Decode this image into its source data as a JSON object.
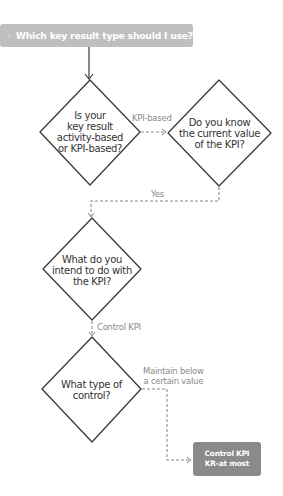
{
  "header": {
    "title": "Which key result type should I use?",
    "icon": "person-question-icon",
    "bg_color": "#bfbfbf"
  },
  "nodes": {
    "q1": {
      "lines": [
        "Is your",
        "key result",
        "activity-based",
        "or KPI-based?"
      ]
    },
    "q2": {
      "lines": [
        "Do you know",
        "the current value",
        "of the KPI?"
      ]
    },
    "q3": {
      "lines": [
        "What do you",
        "intend to do with",
        "the KPI?"
      ]
    },
    "q4": {
      "lines": [
        "What type of",
        "control?"
      ]
    }
  },
  "edges": {
    "q1_to_q2": "KPI-based",
    "q2_to_q3": "Yes",
    "q3_to_q4": "Control KPI",
    "q4_to_result": [
      "Maintain below",
      "a certain value"
    ]
  },
  "result": {
    "lines": [
      "Control KPI",
      "KR-at most"
    ],
    "bg_color": "#8a8a8a"
  },
  "colors": {
    "stroke": "#3a3a3a",
    "dashed": "#8a8a8a",
    "label": "#888888"
  }
}
